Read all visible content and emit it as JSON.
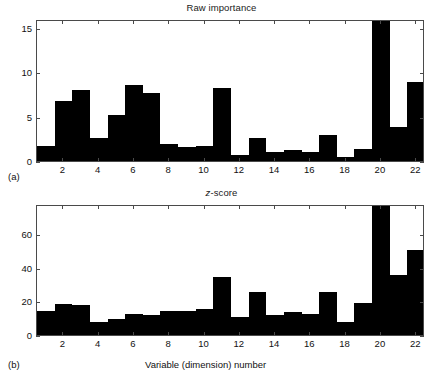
{
  "figure": {
    "panel_a_letter": "(a)",
    "panel_b_letter": "(b)",
    "xaxis_caption": "Variable (dimension) number",
    "bar_color": "#000000",
    "axis_color": "#4a4a4a",
    "background": "#ffffff"
  },
  "chart_data": [
    {
      "type": "bar",
      "id": "raw-importance",
      "title": "Raw importance",
      "title_plain": "Raw importance",
      "xlabel": "",
      "ylabel": "",
      "categories": [
        1,
        2,
        3,
        4,
        5,
        6,
        7,
        8,
        9,
        10,
        11,
        12,
        13,
        14,
        15,
        16,
        17,
        18,
        19,
        20,
        21,
        22
      ],
      "xtick_labels": [
        "2",
        "4",
        "6",
        "8",
        "10",
        "12",
        "14",
        "16",
        "18",
        "20",
        "22"
      ],
      "xtick_values": [
        2,
        4,
        6,
        8,
        10,
        12,
        14,
        16,
        18,
        20,
        22
      ],
      "ytick_labels": [
        "0",
        "5",
        "10",
        "15"
      ],
      "ytick_values": [
        0,
        5,
        10,
        15
      ],
      "xlim": [
        0.5,
        22.5
      ],
      "ylim": [
        0,
        16
      ],
      "clipped_bars": [
        20
      ],
      "grid": false,
      "legend": null,
      "values": [
        1.7,
        6.8,
        8.0,
        2.6,
        5.2,
        8.6,
        7.7,
        1.9,
        1.6,
        1.7,
        8.2,
        0.7,
        2.6,
        1.0,
        1.2,
        1.0,
        2.9,
        0.4,
        1.3,
        16.0,
        3.8,
        8.9
      ]
    },
    {
      "type": "bar",
      "id": "z-score",
      "title": "z-score",
      "title_plain": "z-score",
      "title_italic_prefix": "z",
      "title_rest": "-score",
      "xlabel": "Variable (dimension) number",
      "ylabel": "",
      "categories": [
        1,
        2,
        3,
        4,
        5,
        6,
        7,
        8,
        9,
        10,
        11,
        12,
        13,
        14,
        15,
        16,
        17,
        18,
        19,
        20,
        21,
        22
      ],
      "xtick_labels": [
        "2",
        "4",
        "6",
        "8",
        "10",
        "12",
        "14",
        "16",
        "18",
        "20",
        "22"
      ],
      "xtick_values": [
        2,
        4,
        6,
        8,
        10,
        12,
        14,
        16,
        18,
        20,
        22
      ],
      "ytick_labels": [
        "0",
        "20",
        "40",
        "60"
      ],
      "ytick_values": [
        0,
        20,
        40,
        60
      ],
      "xlim": [
        0.5,
        22.5
      ],
      "ylim": [
        0,
        78
      ],
      "clipped_bars": [
        20
      ],
      "grid": false,
      "legend": null,
      "values": [
        14.5,
        18.5,
        18.0,
        8.0,
        9.5,
        12.5,
        12.0,
        14.2,
        14.5,
        15.5,
        34.5,
        10.8,
        25.5,
        12.0,
        13.5,
        12.8,
        25.8,
        8.0,
        19.0,
        78.0,
        36.0,
        50.5
      ]
    }
  ]
}
